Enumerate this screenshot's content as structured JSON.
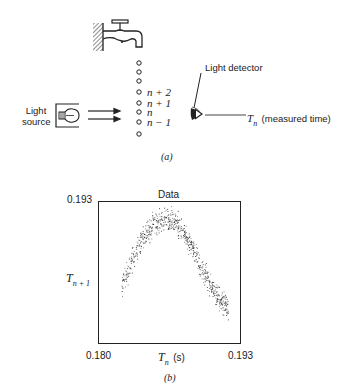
{
  "panel_a": {
    "caption": "(a)",
    "light_source_label": [
      "Light",
      "source"
    ],
    "light_detector_label": "Light detector",
    "measured_time_symbol": "T",
    "measured_time_subscript": "n",
    "measured_time_label": "(measured time)",
    "drop_labels": [
      "n + 2",
      "n + 1",
      "n",
      "n − 1"
    ],
    "drop_count": 8,
    "icons": [
      "faucet-icon",
      "wall-hatch-icon",
      "light-bulb-icon",
      "arrow-right-icon",
      "eye-detector-icon",
      "water-drop-icon"
    ]
  },
  "panel_b": {
    "caption": "(b)",
    "title": "Data",
    "x_tick_min": "0.180",
    "x_tick_max": "0.193",
    "y_tick_max": "0.193",
    "xlabel_symbol": "T",
    "xlabel_subscript": "n",
    "xlabel_unit": "(s)",
    "ylabel_symbol": "T",
    "ylabel_subscript": "n + 1"
  },
  "chart_data": {
    "type": "scatter",
    "title": "Data",
    "xlabel": "T_n (s)",
    "ylabel": "T_n+1",
    "xlim": [
      0.18,
      0.193
    ],
    "ylim": [
      0.18,
      0.193
    ],
    "grid": false,
    "legend": null,
    "approx_point_count": 700,
    "band_centerline": {
      "x": [
        0.1821,
        0.183,
        0.184,
        0.185,
        0.186,
        0.187,
        0.188,
        0.189,
        0.19,
        0.191,
        0.192
      ],
      "y": [
        0.1852,
        0.1875,
        0.1895,
        0.1908,
        0.1914,
        0.1912,
        0.19,
        0.188,
        0.186,
        0.1843,
        0.183
      ]
    },
    "band_half_width": 0.0012
  }
}
